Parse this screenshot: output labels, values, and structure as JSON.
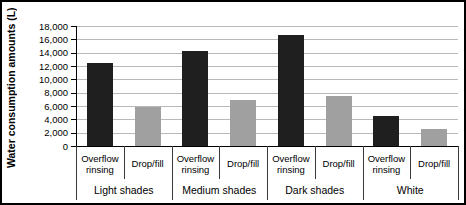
{
  "figure": {
    "background": "#ffffff",
    "frame_color": "#000000"
  },
  "chart_data": {
    "type": "bar",
    "title": "",
    "ylabel": "Water consumption amounts (L)",
    "xlabel": "",
    "ylim": [
      0,
      18000
    ],
    "ytick_interval": 2000,
    "ytick_labels": [
      "18,000",
      "16,000",
      "14,000",
      "12,000",
      "10,000",
      "8,000",
      "6,000",
      "4,000",
      "2,000",
      "0"
    ],
    "grid": "horizontal",
    "grid_color": "#b9b9b9",
    "legend": "none",
    "categories": [
      "Light shades",
      "Medium shades",
      "Dark shades",
      "White"
    ],
    "sub_categories": [
      "Overflow rinsing",
      "Drop/fill"
    ],
    "series": [
      {
        "name": "Overflow rinsing",
        "color": "#1f1f1f",
        "values": [
          12400,
          14200,
          16600,
          4500
        ]
      },
      {
        "name": "Drop/fill",
        "color": "#a0a0a0",
        "values": [
          5800,
          6900,
          7500,
          2500
        ]
      }
    ]
  }
}
